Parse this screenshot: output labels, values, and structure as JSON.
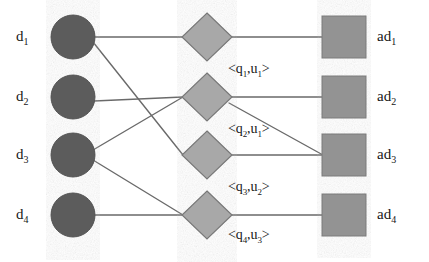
{
  "figure": {
    "type": "tripartite-graph",
    "colors": {
      "circle_fill": "#5c5c5c",
      "circle_stroke": "#4a4a4a",
      "diamond_fill": "#a8a8a8",
      "diamond_stroke": "#6f6f6f",
      "square_fill": "#939393",
      "square_stroke": "#6f6f6f",
      "edge": "#6a6a6a",
      "background": "#ffffff",
      "text": "#161616"
    }
  },
  "columns": {
    "documents": {
      "name": "document-nodes",
      "shape": "circle",
      "nodes": [
        {
          "id": "d1",
          "label": "d",
          "sub": "1",
          "cx": 73,
          "cy": 37,
          "r": 22
        },
        {
          "id": "d2",
          "label": "d",
          "sub": "2",
          "cx": 73,
          "cy": 97,
          "r": 22
        },
        {
          "id": "d3",
          "label": "d",
          "sub": "3",
          "cx": 73,
          "cy": 155,
          "r": 22
        },
        {
          "id": "d4",
          "label": "d",
          "sub": "4",
          "cx": 73,
          "cy": 215,
          "r": 22
        }
      ]
    },
    "pairs": {
      "name": "query-user-pair-nodes",
      "shape": "diamond",
      "nodes": [
        {
          "id": "p1",
          "cx": 207,
          "cy": 37,
          "rx": 25,
          "ry": 24,
          "label": "<q",
          "sub1": "1",
          "mid": ",u",
          "sub2": "1",
          "close": ">"
        },
        {
          "id": "p2",
          "cx": 207,
          "cy": 97,
          "rx": 25,
          "ry": 24,
          "label": "<q",
          "sub1": "2",
          "mid": ",u",
          "sub2": "1",
          "close": ">"
        },
        {
          "id": "p3",
          "cx": 207,
          "cy": 155,
          "rx": 25,
          "ry": 24,
          "label": "<q",
          "sub1": "3",
          "mid": ",u",
          "sub2": "2",
          "close": ">"
        },
        {
          "id": "p4",
          "cx": 207,
          "cy": 215,
          "rx": 25,
          "ry": 24,
          "label": "<q",
          "sub1": "4",
          "mid": ",u",
          "sub2": "3",
          "close": ">"
        }
      ]
    },
    "ads": {
      "name": "ad-nodes",
      "shape": "square",
      "nodes": [
        {
          "id": "ad1",
          "label": "ad",
          "sub": "1",
          "x": 322,
          "y": 16,
          "w": 44,
          "h": 42
        },
        {
          "id": "ad2",
          "label": "ad",
          "sub": "2",
          "x": 322,
          "y": 76,
          "w": 44,
          "h": 42
        },
        {
          "id": "ad3",
          "label": "ad",
          "sub": "3",
          "x": 322,
          "y": 134,
          "w": 44,
          "h": 42
        },
        {
          "id": "ad4",
          "label": "ad",
          "sub": "4",
          "x": 322,
          "y": 194,
          "w": 44,
          "h": 42
        }
      ]
    }
  },
  "edges": [
    {
      "from": "d1",
      "to": "p1",
      "x1": 95,
      "y1": 37,
      "x2": 182,
      "y2": 37
    },
    {
      "from": "d1",
      "to": "p3",
      "x1": 93,
      "y1": 42,
      "x2": 182,
      "y2": 155
    },
    {
      "from": "d2",
      "to": "p2",
      "x1": 94,
      "y1": 101,
      "x2": 182,
      "y2": 97
    },
    {
      "from": "d3",
      "to": "p2",
      "x1": 93,
      "y1": 150,
      "x2": 182,
      "y2": 97
    },
    {
      "from": "d3",
      "to": "p4",
      "x1": 93,
      "y1": 160,
      "x2": 182,
      "y2": 215
    },
    {
      "from": "d4",
      "to": "p4",
      "x1": 95,
      "y1": 215,
      "x2": 182,
      "y2": 215
    },
    {
      "from": "p1",
      "to": "ad1",
      "x1": 232,
      "y1": 37,
      "x2": 322,
      "y2": 37
    },
    {
      "from": "p2",
      "to": "ad2",
      "x1": 232,
      "y1": 97,
      "x2": 322,
      "y2": 97
    },
    {
      "from": "p2",
      "to": "ad3",
      "x1": 230,
      "y1": 102,
      "x2": 322,
      "y2": 155
    },
    {
      "from": "p3",
      "to": "ad3",
      "x1": 232,
      "y1": 155,
      "x2": 322,
      "y2": 155
    },
    {
      "from": "p4",
      "to": "ad4",
      "x1": 232,
      "y1": 215,
      "x2": 322,
      "y2": 215
    }
  ],
  "labels": {
    "documents": [
      {
        "text": "d",
        "sub": "1",
        "x": 16,
        "y": 30
      },
      {
        "text": "d",
        "sub": "2",
        "x": 16,
        "y": 90
      },
      {
        "text": "d",
        "sub": "3",
        "x": 16,
        "y": 148
      },
      {
        "text": "d",
        "sub": "4",
        "x": 16,
        "y": 208
      }
    ],
    "ads": [
      {
        "text": "ad",
        "sub": "1",
        "x": 378,
        "y": 30
      },
      {
        "text": "ad",
        "sub": "2",
        "x": 378,
        "y": 90
      },
      {
        "text": "ad",
        "sub": "3",
        "x": 378,
        "y": 148
      },
      {
        "text": "ad",
        "sub": "4",
        "x": 378,
        "y": 208
      }
    ],
    "pairs": [
      {
        "full": "<q1,u1>",
        "x": 228,
        "y": 64
      },
      {
        "full": "<q2,u1>",
        "x": 228,
        "y": 124
      },
      {
        "full": "<q3,u2>",
        "x": 228,
        "y": 182
      },
      {
        "full": "<q4,u3>",
        "x": 228,
        "y": 230
      }
    ]
  },
  "text": {
    "d1": "d",
    "d2": "d",
    "d3": "d",
    "d4": "d",
    "d1_sub": "1",
    "d2_sub": "2",
    "d3_sub": "3",
    "d4_sub": "4",
    "ad1": "ad",
    "ad2": "ad",
    "ad3": "ad",
    "ad4": "ad",
    "ad1_sub": "1",
    "ad2_sub": "2",
    "ad3_sub": "3",
    "ad4_sub": "4",
    "open": "<",
    "close": ">",
    "comma": ",",
    "q": "q",
    "u": "u",
    "p1_q": "1",
    "p1_u": "1",
    "p2_q": "2",
    "p2_u": "1",
    "p3_q": "3",
    "p3_u": "2",
    "p4_q": "4",
    "p4_u": "3"
  }
}
